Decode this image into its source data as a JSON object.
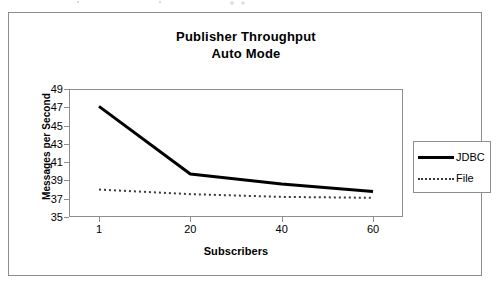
{
  "figure": {
    "frame_border_color": "#8d8d8d",
    "background": "#ffffff"
  },
  "chart_data": {
    "type": "line",
    "title": "Publisher Throughput",
    "subtitle": "Auto Mode",
    "xlabel": "Subscribers",
    "ylabel": "Messages per Second",
    "categories": [
      "1",
      "20",
      "40",
      "60"
    ],
    "x": [
      1,
      20,
      40,
      60
    ],
    "ylim": [
      35,
      49
    ],
    "yticks": [
      35,
      37,
      39,
      41,
      43,
      45,
      47,
      49
    ],
    "grid": false,
    "legend_position": "right",
    "series": [
      {
        "name": "JDBC",
        "values": [
          47.1,
          39.7,
          38.6,
          37.8
        ],
        "color": "#000000",
        "line_style": "solid",
        "line_width": 3
      },
      {
        "name": "File",
        "values": [
          38.0,
          37.5,
          37.2,
          37.1
        ],
        "color": "#3a3a3a",
        "line_style": "dotted",
        "line_width": 2
      }
    ]
  }
}
